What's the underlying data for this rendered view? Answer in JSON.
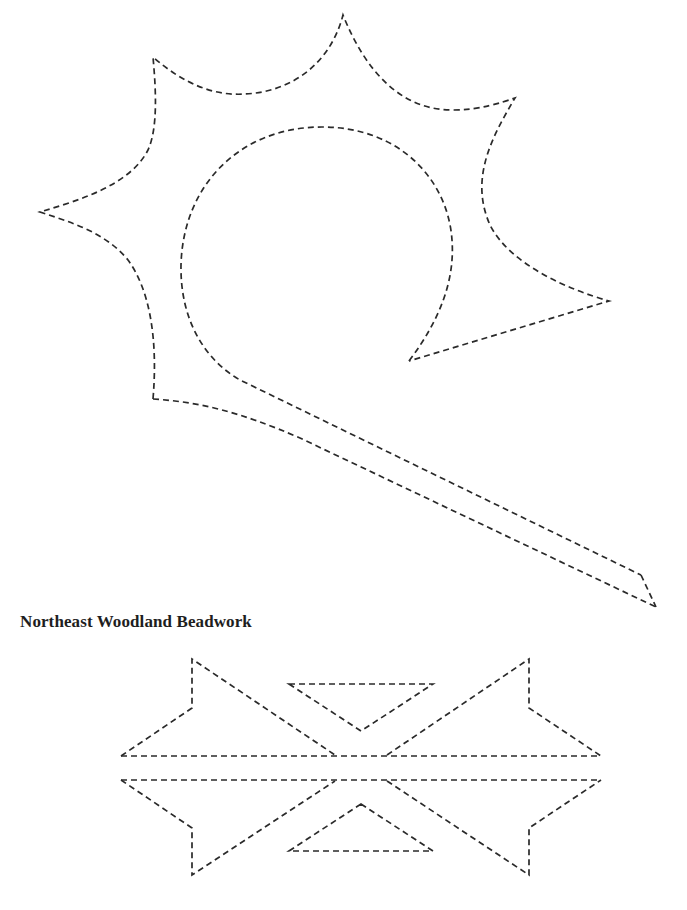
{
  "page": {
    "background": "#ffffff",
    "line_color": "#2a2a2a"
  },
  "top_figure": {
    "label": "",
    "description": "Dashed-outline floral/club template with spiked outer edge, circular inner loop and long diagonal stem"
  },
  "caption": {
    "text": "Northeast Woodland Beadwork"
  },
  "bottom_figure": {
    "description": "Dashed-outline symmetrical beadwork band with four star points and two inner triangles"
  }
}
